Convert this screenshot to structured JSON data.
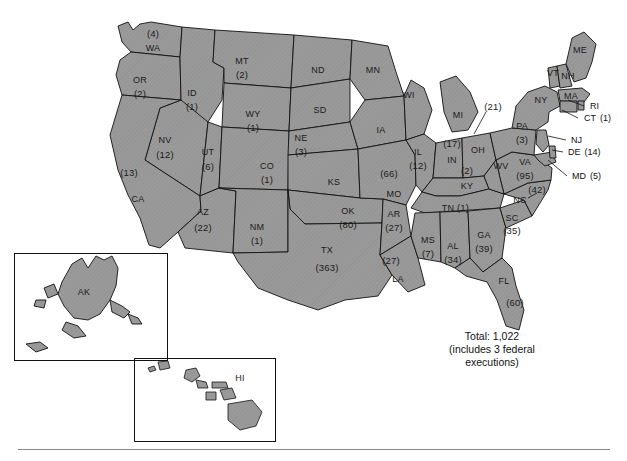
{
  "figure": {
    "title_text": "",
    "total_label": "Total: 1,022",
    "total_note": "(includes 3 federal executions)",
    "colors": {
      "state_fill": "#999999",
      "state_stroke": "#111111",
      "background": "#ffffff",
      "text": "#111111",
      "rule": "#8a8a8a"
    }
  },
  "map": {
    "type": "choropleth-counts",
    "region": "United States",
    "insets": [
      {
        "name": "alaska-inset",
        "label": "AK"
      },
      {
        "name": "hawaii-inset",
        "label": "HI"
      }
    ],
    "states": [
      {
        "abbr": "WA",
        "count": "(4)",
        "x": 153,
        "y": 48,
        "cx": 153,
        "cy": 34,
        "layout": "count-above"
      },
      {
        "abbr": "OR",
        "count": "(2)",
        "x": 140,
        "y": 80,
        "cx": 140,
        "cy": 94,
        "layout": "count-below"
      },
      {
        "abbr": "ID",
        "count": "(1)",
        "x": 192,
        "y": 93,
        "cx": 192,
        "cy": 107,
        "layout": "count-below"
      },
      {
        "abbr": "MT",
        "count": "(2)",
        "x": 242,
        "y": 61,
        "cx": 242,
        "cy": 75,
        "layout": "count-below"
      },
      {
        "abbr": "WY",
        "count": "(1)",
        "x": 253,
        "y": 114,
        "cx": 253,
        "cy": 128,
        "layout": "count-below"
      },
      {
        "abbr": "NV",
        "count": "(12)",
        "x": 165,
        "y": 140,
        "cx": 165,
        "cy": 155,
        "layout": "count-below"
      },
      {
        "abbr": "UT",
        "count": "(6)",
        "x": 208,
        "y": 152,
        "cx": 208,
        "cy": 167,
        "layout": "count-below"
      },
      {
        "abbr": "CO",
        "count": "(1)",
        "x": 267,
        "y": 166,
        "cx": 267,
        "cy": 180,
        "layout": "count-below"
      },
      {
        "abbr": "CA",
        "count": "(13)",
        "x": 138,
        "y": 199,
        "cx": 129,
        "cy": 173,
        "layout": "count-above-left"
      },
      {
        "abbr": "AZ",
        "count": "(22)",
        "x": 203,
        "y": 212,
        "cx": 203,
        "cy": 228,
        "layout": "count-below"
      },
      {
        "abbr": "NM",
        "count": "(1)",
        "x": 257,
        "y": 227,
        "cx": 257,
        "cy": 241,
        "layout": "count-below"
      },
      {
        "abbr": "ND",
        "count": "",
        "x": 318,
        "y": 70,
        "cx": 0,
        "cy": 0,
        "layout": "name-only"
      },
      {
        "abbr": "SD",
        "count": "",
        "x": 320,
        "y": 110,
        "cx": 0,
        "cy": 0,
        "layout": "name-only"
      },
      {
        "abbr": "NE",
        "count": "(3)",
        "x": 301,
        "y": 138,
        "cx": 301,
        "cy": 152,
        "layout": "count-below"
      },
      {
        "abbr": "KS",
        "count": "",
        "x": 334,
        "y": 182,
        "cx": 0,
        "cy": 0,
        "layout": "name-only"
      },
      {
        "abbr": "OK",
        "count": "(80)",
        "x": 348,
        "y": 211,
        "cx": 348,
        "cy": 225,
        "layout": "count-below"
      },
      {
        "abbr": "TX",
        "count": "(363)",
        "x": 327,
        "y": 250,
        "cx": 327,
        "cy": 268,
        "layout": "count-below"
      },
      {
        "abbr": "MN",
        "count": "",
        "x": 373,
        "y": 70,
        "cx": 0,
        "cy": 0,
        "layout": "name-only"
      },
      {
        "abbr": "IA",
        "count": "",
        "x": 381,
        "y": 130,
        "cx": 0,
        "cy": 0,
        "layout": "name-only"
      },
      {
        "abbr": "MO",
        "count": "(66)",
        "x": 394,
        "y": 194,
        "cx": 389,
        "cy": 174,
        "layout": "count-above"
      },
      {
        "abbr": "AR",
        "count": "(27)",
        "x": 394,
        "y": 214,
        "cx": 394,
        "cy": 228,
        "layout": "count-below"
      },
      {
        "abbr": "LA",
        "count": "(27)",
        "x": 398,
        "y": 279,
        "cx": 391,
        "cy": 261,
        "layout": "count-above"
      },
      {
        "abbr": "WI",
        "count": "",
        "x": 409,
        "y": 95,
        "cx": 0,
        "cy": 0,
        "layout": "name-only"
      },
      {
        "abbr": "IL",
        "count": "(12)",
        "x": 418,
        "y": 152,
        "cx": 418,
        "cy": 166,
        "layout": "count-below"
      },
      {
        "abbr": "MI",
        "count": "",
        "x": 458,
        "y": 115,
        "cx": 0,
        "cy": 0,
        "layout": "name-only"
      },
      {
        "abbr": "IN",
        "count": "(17)",
        "x": 452,
        "y": 160,
        "cx": 452,
        "cy": 144,
        "layout": "count-above"
      },
      {
        "abbr": "KY",
        "count": "(2)",
        "x": 467,
        "y": 186,
        "cx": 467,
        "cy": 171,
        "layout": "count-above"
      },
      {
        "abbr": "TN",
        "count": "(1)",
        "x": 448,
        "y": 208,
        "cx": 463,
        "cy": 208,
        "layout": "count-inline"
      },
      {
        "abbr": "MS",
        "count": "(7)",
        "x": 428,
        "y": 240,
        "cx": 428,
        "cy": 254,
        "layout": "count-below"
      },
      {
        "abbr": "AL",
        "count": "(34)",
        "x": 453,
        "y": 246,
        "cx": 453,
        "cy": 260,
        "layout": "count-below"
      },
      {
        "abbr": "GA",
        "count": "(39)",
        "x": 484,
        "y": 235,
        "cx": 484,
        "cy": 249,
        "layout": "count-below"
      },
      {
        "abbr": "FL",
        "count": "(60)",
        "x": 504,
        "y": 281,
        "cx": 515,
        "cy": 303,
        "layout": "count-below-right"
      },
      {
        "abbr": "SC",
        "count": "(35)",
        "x": 512,
        "y": 218,
        "cx": 512,
        "cy": 231,
        "layout": "count-below"
      },
      {
        "abbr": "NC",
        "count": "(42)",
        "x": 520,
        "y": 200,
        "cx": 537,
        "cy": 190,
        "layout": "count-offset"
      },
      {
        "abbr": "VA",
        "count": "(95)",
        "x": 525,
        "y": 162,
        "cx": 525,
        "cy": 176,
        "layout": "count-below"
      },
      {
        "abbr": "WV",
        "count": "",
        "x": 501,
        "y": 166,
        "cx": 0,
        "cy": 0,
        "layout": "name-only"
      },
      {
        "abbr": "OH",
        "count": "(21)",
        "x": 478,
        "y": 150,
        "cx": 493,
        "cy": 107,
        "layout": "count-leader"
      },
      {
        "abbr": "PA",
        "count": "(3)",
        "x": 522,
        "y": 126,
        "cx": 522,
        "cy": 140,
        "layout": "count-below"
      },
      {
        "abbr": "NY",
        "count": "",
        "x": 541,
        "y": 100,
        "cx": 0,
        "cy": 0,
        "layout": "name-only"
      },
      {
        "abbr": "VT",
        "count": "",
        "x": 553,
        "y": 73,
        "cx": 0,
        "cy": 0,
        "layout": "name-only"
      },
      {
        "abbr": "NH",
        "count": "",
        "x": 568,
        "y": 76,
        "cx": 0,
        "cy": 0,
        "layout": "name-only"
      },
      {
        "abbr": "ME",
        "count": "",
        "x": 580,
        "y": 50,
        "cx": 0,
        "cy": 0,
        "layout": "name-only"
      },
      {
        "abbr": "MA",
        "count": "",
        "x": 571,
        "y": 96,
        "cx": 0,
        "cy": 0,
        "layout": "name-only"
      }
    ],
    "callouts": [
      {
        "name": "callout-ri",
        "label": "RI",
        "count": "",
        "x": 590,
        "y": 106
      },
      {
        "name": "callout-ct",
        "label": "CT",
        "count": "(1)",
        "x": 584,
        "y": 118
      },
      {
        "name": "callout-nj",
        "label": "NJ",
        "count": "",
        "x": 571,
        "y": 140
      },
      {
        "name": "callout-de",
        "label": "DE",
        "count": "(14)",
        "x": 568,
        "y": 152
      },
      {
        "name": "callout-md",
        "label": "MD",
        "count": "(5)",
        "x": 572,
        "y": 176
      }
    ]
  },
  "chart_data": {
    "type": "choropleth",
    "title": "Total: 1,022",
    "subtitle": "(includes 3 federal executions)",
    "value_label": "executions",
    "total": 1022,
    "federal_executions": 3,
    "categories": [
      "TX",
      "VA",
      "OK",
      "MO",
      "FL",
      "NC",
      "GA",
      "SC",
      "AL",
      "AR",
      "LA",
      "AZ",
      "IN",
      "OH",
      "DE",
      "CA",
      "NV",
      "IL",
      "MS",
      "UT",
      "WA",
      "PA",
      "NJ",
      "VA_other",
      "KY",
      "MT",
      "OR",
      "ID",
      "WY",
      "CO",
      "NM",
      "TN",
      "NE",
      "MD",
      "CT",
      "NY",
      "MA",
      "ME",
      "VT",
      "NH",
      "RI",
      "ND",
      "SD",
      "MN",
      "WI",
      "IA",
      "KS",
      "MI",
      "WV",
      "AK",
      "HI"
    ],
    "values": [
      363,
      95,
      80,
      66,
      60,
      42,
      39,
      35,
      34,
      27,
      27,
      22,
      17,
      21,
      14,
      13,
      12,
      12,
      7,
      6,
      4,
      3,
      0,
      0,
      2,
      2,
      2,
      1,
      1,
      1,
      1,
      1,
      3,
      5,
      1,
      0,
      0,
      0,
      0,
      0,
      0,
      0,
      0,
      0,
      0,
      0,
      0,
      0,
      0,
      0,
      0
    ],
    "labeled_states": {
      "TX": 363,
      "VA": 95,
      "OK": 80,
      "MO": 66,
      "FL": 60,
      "NC": 42,
      "GA": 39,
      "SC": 35,
      "AL": 34,
      "AR": 27,
      "LA": 27,
      "AZ": 22,
      "OH": 21,
      "IN": 17,
      "DE": 14,
      "CA": 13,
      "NV": 12,
      "IL": 12,
      "MS": 7,
      "UT": 6,
      "MD": 5,
      "WA": 4,
      "PA": 3,
      "NE": 3,
      "KY": 2,
      "MT": 2,
      "OR": 2,
      "ID": 1,
      "WY": 1,
      "CO": 1,
      "NM": 1,
      "TN": 1,
      "CT": 1
    },
    "unlabeled_states": [
      "ND",
      "SD",
      "MN",
      "WI",
      "IA",
      "KS",
      "MI",
      "WV",
      "NY",
      "VT",
      "NH",
      "ME",
      "MA",
      "RI",
      "NJ",
      "AK",
      "HI"
    ],
    "legend_position": "none",
    "grid": false
  }
}
